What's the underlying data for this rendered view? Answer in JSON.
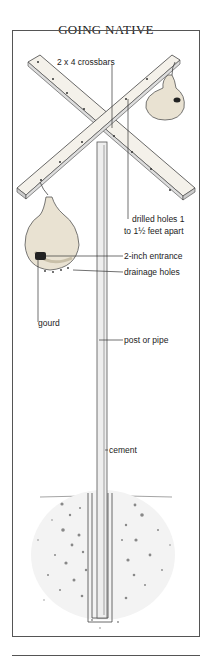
{
  "title": "GOING NATIVE",
  "labels": {
    "crossbars": "2 x 4 crossbars",
    "holes_line1": "drilled holes 1",
    "holes_line2": "to 1½ feet apart",
    "entrance": "2-inch entrance",
    "drainage": "drainage holes",
    "gourd": "gourd",
    "post": "post or pipe",
    "cement": "cement"
  },
  "colors": {
    "line": "#333333",
    "wood": "#f4f1ea",
    "gourd": "#e9e2d2",
    "entrance": "#222222"
  }
}
